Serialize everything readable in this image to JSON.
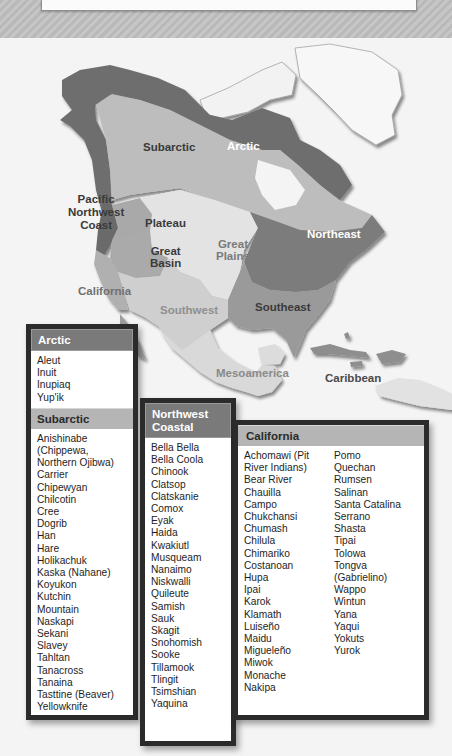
{
  "map": {
    "labels": {
      "subarctic": "Subarctic",
      "arctic": "Arctic",
      "pacific_nw": [
        "Pacific",
        "Northwest",
        "Coast"
      ],
      "plateau": "Plateau",
      "great_basin": [
        "Great",
        "Basin"
      ],
      "great_plains": [
        "Great",
        "Plains"
      ],
      "northeast": "Northeast",
      "california": "California",
      "southwest": "Southwest",
      "southeast": "Southeast",
      "mesoamerica": "Mesoamerica",
      "caribbean": "Caribbean"
    },
    "colors": {
      "arctic": "#6e6e6e",
      "subarctic": "#bdbdbd",
      "greenland": "#f7f7f7",
      "plains": "#e3e3e3",
      "northeast": "#7c7c7c",
      "southeast": "#9a9a9a",
      "basin": "#aaaaaa",
      "california": "#b0b0b0",
      "southwest": "#cfcfcf",
      "meso": "#d9d9d9"
    }
  },
  "legend": {
    "arctic": {
      "title": "Arctic",
      "items": [
        "Aleut",
        "Inuit",
        "Inupiaq",
        "Yup'ik"
      ]
    },
    "subarctic": {
      "title": "Subarctic",
      "items": [
        "Anishinabe",
        "(Chippewa,",
        "Northern Ojibwa)",
        "Carrier",
        "Chipewyan",
        "Chilcotin",
        "Cree",
        "Dogrib",
        "Han",
        "Hare",
        "Holikachuk",
        "Kaska (Nahane)",
        "Koyukon",
        "Kutchin",
        "Mountain",
        "Naskapi",
        "Sekani",
        "Slavey",
        "Tahltan",
        "Tanacross",
        "Tanaina",
        "Tasttine (Beaver)",
        "Yellowknife"
      ]
    },
    "northwest_coastal": {
      "title": [
        "Northwest",
        "Coastal"
      ],
      "items": [
        "Bella Bella",
        "Bella Coola",
        "Chinook",
        "Clatsop",
        "Clatskanie",
        "Comox",
        "Eyak",
        "Haida",
        "Kwakiutl",
        "Musqueam",
        "Nanaimo",
        "Niskwalli",
        "Quileute",
        "Samish",
        "Sauk",
        "Skagit",
        "Snohomish",
        "Sooke",
        "Tillamook",
        "Tlingit",
        "Tsimshian",
        "Yaquina"
      ]
    },
    "california": {
      "title": "California",
      "col1": [
        "Achomawi (Pit",
        "River Indians)",
        "Bear River",
        "Chauilla",
        "Campo",
        "Chukchansi",
        "Chumash",
        "Chilula",
        "Chimariko",
        "Costanoan",
        "Hupa",
        "Ipai",
        "Karok",
        "Klamath",
        "Luiseño",
        "Maidu",
        "Migueleño",
        "Miwok",
        "Monache",
        "Nakipa"
      ],
      "col2": [
        "Pomo",
        "Quechan",
        "Rumsen",
        "Salinan",
        "Santa Catalina",
        "Serrano",
        "Shasta",
        "Tipai",
        "Tolowa",
        "Tongva",
        "(Gabrielino)",
        "Wappo",
        "Wintun",
        "Yana",
        "Yaqui",
        "Yokuts",
        "Yurok"
      ]
    }
  }
}
